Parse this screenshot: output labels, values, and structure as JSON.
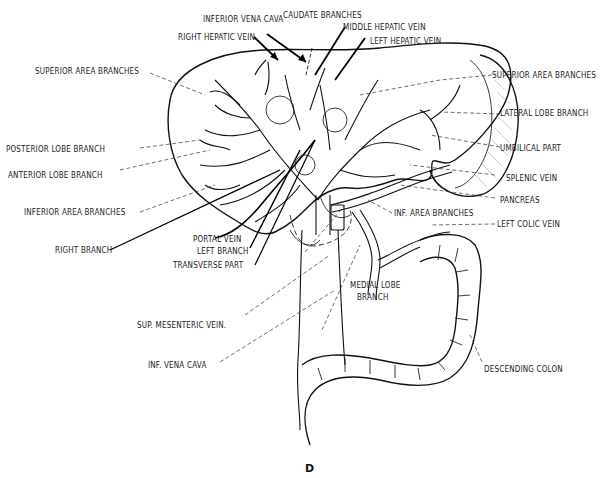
{
  "figure": {
    "panel_label": "D"
  },
  "labels": {
    "inferior_vena_cava_top": "INFERIOR VENA CAVA",
    "caudate_branches": "CAUDATE BRANCHES",
    "middle_hepatic_vein": "MIDDLE HEPATIC VEIN",
    "right_hepatic_vein": "RIGHT HEPATIC VEIN",
    "left_hepatic_vein": "LEFT HEPATIC VEIN",
    "superior_area_branches_left": "SUPERIOR AREA BRANCHES",
    "superior_area_branches_right": "SUPERIOR AREA BRANCHES",
    "lateral_lobe_branch": "LATERAL LOBE BRANCH",
    "posterior_lobe_branch": "POSTERIOR LOBE BRANCH",
    "umbilical_part": "UMBILICAL PART",
    "anterior_lobe_branch": "ANTERIOR LOBE BRANCH",
    "splenic_vein": "SPLENIC VEIN",
    "pancreas": "PANCREAS",
    "inferior_area_branches": "INFERIOR AREA BRANCHES",
    "inf_area_branches": "INF. AREA BRANCHES",
    "left_colic_vein": "LEFT COLIC VEIN",
    "right_branch": "RIGHT BRANCH",
    "portal_vein": "PORTAL VEIN",
    "left_branch": "LEFT BRANCH",
    "transverse_part": "TRANSVERSE PART",
    "medial_lobe_branch_1": "MEDIAL LOBE",
    "medial_lobe_branch_2": "BRANCH",
    "sup_mesenteric_vein": "SUP. MESENTERIC VEIN.",
    "inf_vena_cava_bottom": "INF. VENA CAVA",
    "descending_colon": "DESCENDING COLON"
  }
}
